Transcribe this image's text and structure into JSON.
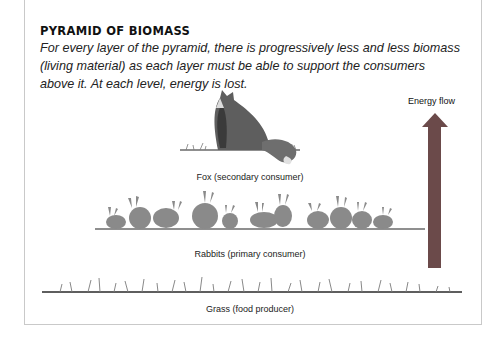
{
  "title": "PYRAMID OF BIOMASS",
  "description": "For every layer of the pyramid, there is progressively less and less biomass (living material) as each layer must be able to support the consumers above it. At each level, energy is lost.",
  "energy_flow": {
    "label": "Energy flow",
    "direction": "up",
    "color": "#6b4a4a"
  },
  "levels": [
    {
      "id": "fox",
      "label": "Fox (secondary consumer)",
      "count": 1
    },
    {
      "id": "rabbits",
      "label": "Rabbits (primary consumer)",
      "count": 13
    },
    {
      "id": "grass",
      "label": "Grass (food producer)"
    }
  ]
}
